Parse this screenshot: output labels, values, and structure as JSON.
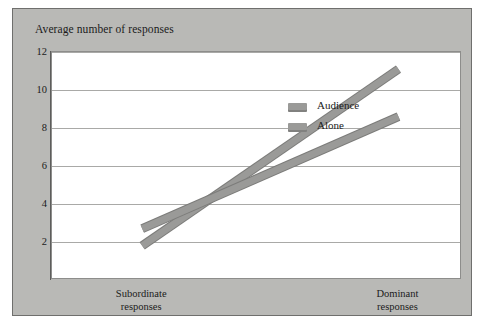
{
  "figure": {
    "title": "Average number of responses",
    "panel_color": "#b9b9b6",
    "plot_background": "#ffffff",
    "border_color": "#6f6f6d",
    "gridline_color": "#a9a9a7"
  },
  "legend": {
    "position": "inside-top-center",
    "entries": [
      {
        "label": "Audience",
        "color": "#9a9a98",
        "swatch": "legend-swatch-audience"
      },
      {
        "label": "Alone",
        "color": "#9a9a98",
        "swatch": "legend-swatch-alone"
      }
    ]
  },
  "chart_data": {
    "type": "line",
    "title": "Average number of responses",
    "xlabel": "",
    "ylabel": "Average number of responses",
    "categories": [
      "Subordinate responses",
      "Dominant responses"
    ],
    "category_lines": [
      [
        "Subordinate",
        "responses"
      ],
      [
        "Dominant",
        "responses"
      ]
    ],
    "series": [
      {
        "name": "Audience",
        "values": [
          1.8,
          11.1
        ],
        "color": "#9a9a98"
      },
      {
        "name": "Alone",
        "values": [
          2.7,
          8.6
        ],
        "color": "#9a9a98"
      }
    ],
    "ylim": [
      0,
      12
    ],
    "yticks": [
      2,
      4,
      6,
      8,
      10,
      12
    ],
    "ytick_labels": [
      "2",
      "4",
      "6",
      "8",
      "10",
      "12"
    ],
    "grid": true,
    "legend_position": "inside-top-center",
    "crossing_point": {
      "x_fraction": 0.53,
      "y_value": 6.0
    }
  }
}
